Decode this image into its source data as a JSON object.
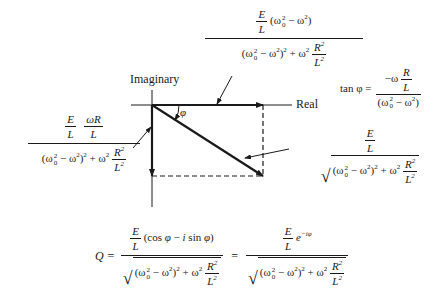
{
  "diagram": {
    "axes": {
      "real_label": "Real",
      "imaginary_label": "Imaginary"
    },
    "angle_label": "φ",
    "colors": {
      "ink": "#1a1a1a",
      "background": "#ffffff"
    }
  },
  "labels": {
    "real_component": {
      "numerator_E": "E",
      "numerator_L": "L",
      "numerator_factor": "(ω₀² − ω²)",
      "denominator": "(ω₀² − ω²)² + ω² R²/L²"
    },
    "imaginary_component": {
      "numerator_E": "E",
      "numerator_L": "L",
      "numerator_wR": "ωR",
      "numerator_L2": "L",
      "denominator": "(ω₀² − ω²)² + ω² R²/L²"
    },
    "magnitude": {
      "numerator_E": "E",
      "numerator_L": "L",
      "denominator": "√((ω₀² − ω²)² + ω² R²/L²)"
    },
    "tan_phi": {
      "lhs": "tan φ =",
      "numerator": "−ω R/L",
      "denominator": "(ω₀² − ω²)"
    }
  },
  "equation": {
    "lhs": "Q =",
    "term1_numerator": "E/L (cos φ − i sin φ)",
    "term1_denominator": "√((ω₀² − ω²)² + ω² R²/L²)",
    "equals": "=",
    "term2_numerator": "E/L e^(−iφ)",
    "term2_denominator": "√((ω₀² − ω²)² + ω² R²/L²)"
  }
}
